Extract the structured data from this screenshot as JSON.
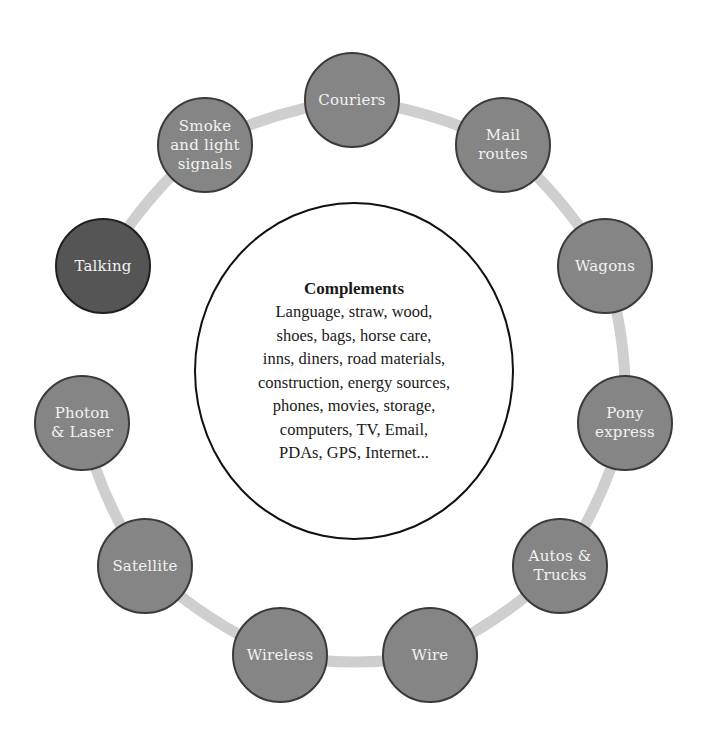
{
  "diagram": {
    "type": "cycle",
    "ring": {
      "color": "#cfcfcf",
      "cx": 354,
      "cy": 380,
      "r": 278,
      "gap_between": [
        "Talking",
        "Photon & Laser"
      ]
    },
    "node_color": "#858585",
    "highlight_color": "#555555",
    "nodes": [
      {
        "id": "couriers",
        "label": "Couriers",
        "cx": 352,
        "cy": 100,
        "highlight": false
      },
      {
        "id": "mail-routes",
        "label": "Mail\nroutes",
        "cx": 503,
        "cy": 145,
        "highlight": false
      },
      {
        "id": "wagons",
        "label": "Wagons",
        "cx": 605,
        "cy": 266,
        "highlight": false
      },
      {
        "id": "pony-express",
        "label": "Pony\nexpress",
        "cx": 625,
        "cy": 423,
        "highlight": false
      },
      {
        "id": "autos-trucks",
        "label": "Autos &\nTrucks",
        "cx": 560,
        "cy": 566,
        "highlight": false
      },
      {
        "id": "wire",
        "label": "Wire",
        "cx": 430,
        "cy": 655,
        "highlight": false
      },
      {
        "id": "wireless",
        "label": "Wireless",
        "cx": 280,
        "cy": 655,
        "highlight": false
      },
      {
        "id": "satellite",
        "label": "Satellite",
        "cx": 145,
        "cy": 566,
        "highlight": false
      },
      {
        "id": "photon-laser",
        "label": "Photon\n& Laser",
        "cx": 82,
        "cy": 423,
        "highlight": false
      },
      {
        "id": "talking",
        "label": "Talking",
        "cx": 103,
        "cy": 266,
        "highlight": true
      },
      {
        "id": "smoke-light-signals",
        "label": "Smoke\nand light\nsignals",
        "cx": 205,
        "cy": 145,
        "highlight": false
      }
    ],
    "center": {
      "title": "Complements",
      "body": "Language, straw, wood,\nshoes, bags, horse care,\ninns, diners, road materials,\nconstruction, energy sources,\nphones, movies, storage,\ncomputers, TV, Email,\nPDAs, GPS, Internet..."
    }
  }
}
